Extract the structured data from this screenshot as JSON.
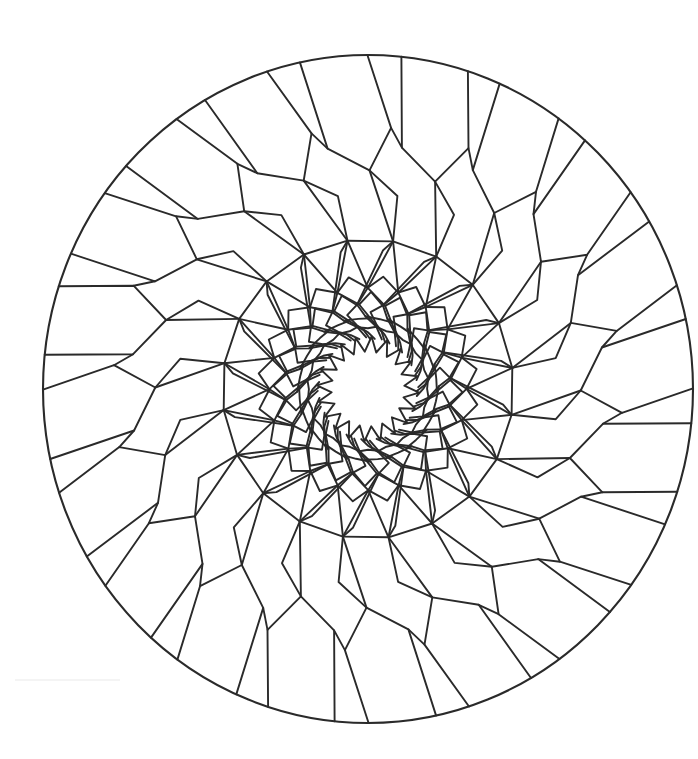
{
  "figure": {
    "canvas": {
      "width": 698,
      "height": 759,
      "background": "#ffffff"
    },
    "line_color": "#2a2a2a",
    "center": {
      "x": 368,
      "y": 389
    },
    "outer_circle": {
      "rx": 325,
      "ry": 334
    },
    "symmetry": 20,
    "base_angle_deg": 5.9,
    "sector_deg": 18,
    "motif_polylines": [
      {
        "name": "rim-pentagon",
        "points": [
          [
            0,
            333
          ],
          [
            2.3,
            241
          ],
          [
            12.5,
            216
          ],
          [
            17.3,
            259
          ],
          [
            12,
            333
          ]
        ]
      },
      {
        "name": "bridge",
        "points": [
          [
            17.3,
            259
          ],
          [
            20.3,
            241
          ]
        ]
      },
      {
        "name": "tip-to-ring1",
        "points": [
          [
            12.5,
            216
          ],
          [
            22,
            148
          ]
        ]
      },
      {
        "name": "kite",
        "points": [
          [
            12.5,
            216
          ],
          [
            21,
            193
          ],
          [
            22,
            148
          ]
        ]
      },
      {
        "name": "ring1-chord",
        "points": [
          [
            22,
            148
          ],
          [
            40,
            148
          ]
        ]
      },
      {
        "name": "ring1-to-ring2",
        "points": [
          [
            22,
            148
          ],
          [
            30,
            100
          ],
          [
            40,
            148
          ]
        ]
      },
      {
        "name": "inner-strand-a",
        "points": [
          [
            30,
            100
          ],
          [
            42,
            84
          ],
          [
            50,
            70
          ],
          [
            62,
            58
          ],
          [
            70,
            48
          ]
        ]
      },
      {
        "name": "inner-strand-b",
        "points": [
          [
            30,
            100
          ],
          [
            22.5,
            84
          ],
          [
            28,
            72
          ],
          [
            38,
            62
          ],
          [
            46,
            51
          ]
        ]
      },
      {
        "name": "inner-strand-c",
        "points": [
          [
            40,
            148
          ],
          [
            36.5,
            138
          ],
          [
            22.5,
            84
          ]
        ]
      },
      {
        "name": "inner-strand-d",
        "points": [
          [
            22.5,
            84
          ],
          [
            14,
            76
          ],
          [
            20,
            64
          ],
          [
            30,
            56
          ],
          [
            38,
            50
          ]
        ]
      },
      {
        "name": "inner-rung-1",
        "points": [
          [
            42,
            84
          ],
          [
            50,
            96
          ],
          [
            58,
            84
          ]
        ]
      },
      {
        "name": "inner-rung-2",
        "points": [
          [
            28,
            72
          ],
          [
            40,
            70
          ],
          [
            50,
            70
          ]
        ]
      },
      {
        "name": "inner-rung-3",
        "points": [
          [
            38,
            62
          ],
          [
            48,
            60
          ],
          [
            56,
            62
          ]
        ]
      },
      {
        "name": "ring2-zig",
        "points": [
          [
            30,
            100
          ],
          [
            38,
            112
          ],
          [
            48,
            100
          ]
        ]
      }
    ],
    "center_star": {
      "points": 20,
      "inner_r": 37,
      "outer_r": 52,
      "rotation_deg": 4
    },
    "labels": []
  }
}
